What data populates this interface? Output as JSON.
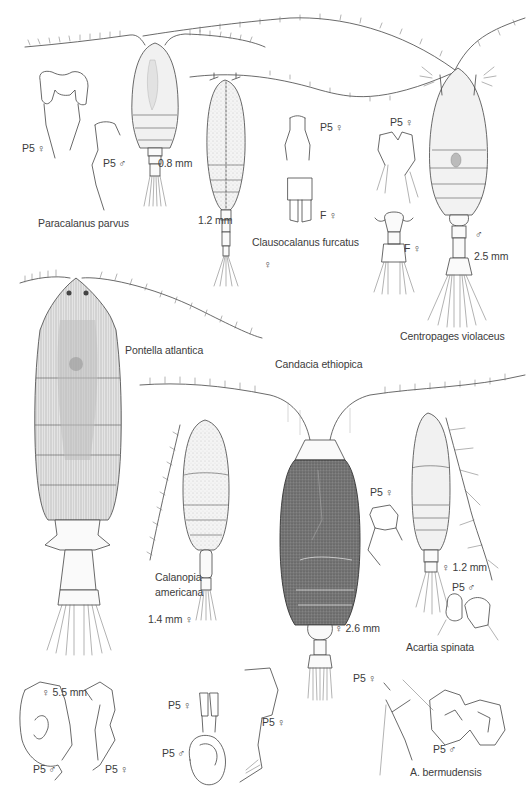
{
  "plate": {
    "title": "Copepod species illustration plate",
    "background": "#ffffff",
    "ink_color": "#444444"
  },
  "specimens": [
    {
      "id": "paracalanus",
      "name": "Paracalanus parvus",
      "size": "0.8 mm",
      "details": [
        {
          "label": "P5 ♀"
        },
        {
          "label": "P5 ♂"
        }
      ]
    },
    {
      "id": "clausocalanus",
      "name": "Clausocalanus furcatus",
      "size": "1.2 mm",
      "sex": "♀",
      "details": [
        {
          "label": "P5 ♀"
        },
        {
          "label": "F ♀"
        }
      ]
    },
    {
      "id": "centropages",
      "name": "Centropages violaceus",
      "size": "2.5 mm",
      "sex": "♂",
      "details": [
        {
          "label": "P5 ♀"
        },
        {
          "label": "F ♀"
        }
      ]
    },
    {
      "id": "pontella",
      "name": "Pontella atlantica",
      "size": "5.5 mm",
      "sex": "♀",
      "details": [
        {
          "label": "P5 ♂"
        },
        {
          "label": "P5 ♀"
        }
      ]
    },
    {
      "id": "candacia",
      "name": "Candacia ethiopica",
      "size": "2.6 mm",
      "sex": "♀",
      "details": [
        {
          "label": "P5 ♀"
        },
        {
          "label": "P5 ♀"
        }
      ]
    },
    {
      "id": "calanopia",
      "name_line1": "Calanopia",
      "name_line2": "americana",
      "size": "1.4 mm",
      "sex": "♀",
      "details": [
        {
          "label": "P5 ♀"
        },
        {
          "label": "P5 ♂"
        }
      ]
    },
    {
      "id": "acartia_spinata",
      "name": "Acartia spinata",
      "size": "1.2 mm",
      "sex": "♀",
      "details": [
        {
          "label": "P5 ♂"
        }
      ]
    },
    {
      "id": "acartia_bermudensis",
      "name": "A. bermudensis",
      "details": [
        {
          "label": "P5 ♀"
        },
        {
          "label": "P5 ♂"
        }
      ]
    }
  ],
  "labels": {
    "paracalanus_name": "Paracalanus parvus",
    "paracalanus_size": "0.8 mm",
    "paracalanus_p5f": "P5 ♀",
    "paracalanus_p5m": "P5 ♂",
    "clauso_name": "Clausocalanus furcatus",
    "clauso_size": "1.2 mm",
    "clauso_sex": "♀",
    "clauso_p5f": "P5 ♀",
    "clauso_ff": "F ♀",
    "centro_name": "Centropages violaceus",
    "centro_sex": "♂",
    "centro_size": "2.5 mm",
    "centro_p5f": "P5 ♀",
    "centro_ff": "F ♀",
    "pontella_name": "Pontella atlantica",
    "pontella_size": "♀   5.5 mm",
    "pontella_p5m": "P5 ♂",
    "pontella_p5f": "P5 ♀",
    "candacia_name": "Candacia ethiopica",
    "candacia_size": "♀  2.6 mm",
    "candacia_p5f_a": "P5 ♀",
    "candacia_p5f_b": "P5 ♀",
    "calanopia_name1": "Calanopia",
    "calanopia_name2": "americana",
    "calanopia_size": "1.4 mm  ♀",
    "calanopia_p5f": "P5 ♀",
    "calanopia_p5m": "P5 ♂",
    "acartia_name": "Acartia spinata",
    "acartia_size": "♀ 1.2 mm",
    "acartia_p5m": "P5 ♂",
    "bermud_name": "A. bermudensis",
    "bermud_p5f": "P5 ♀",
    "bermud_p5m": "P5 ♂"
  }
}
